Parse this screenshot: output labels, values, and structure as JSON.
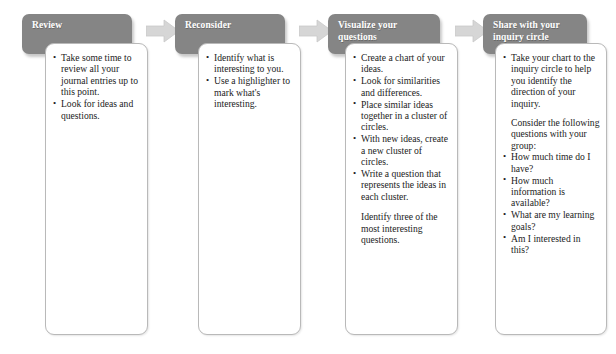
{
  "colors": {
    "header_fill": "#858585",
    "header_text": "#ffffff",
    "card_fill": "#ffffff",
    "card_border": "#b9b9b9",
    "arrow_fill": "#d6d6d6",
    "arrow_border": "#c4c4c4",
    "body_text": "#1b1b1b"
  },
  "steps": [
    {
      "id": "review",
      "title": "Review",
      "bullets": [
        "Take some  time to review all your journal entries up to this point.",
        "Look for ideas and questions."
      ],
      "paragraphs": []
    },
    {
      "id": "reconsider",
      "title": "Reconsider",
      "bullets": [
        "Identify what is interesting  to you.",
        "Use a highlighter to mark what's interesting."
      ],
      "paragraphs": []
    },
    {
      "id": "visualize-your-questions",
      "title": "Visualize your questions",
      "bullets": [
        "Create a chart of your ideas.",
        "Look for similarities and differences.",
        "Place similar ideas  together in a cluster of circles.",
        "With new ideas, create a new cluster of circles.",
        "Write a question that represents the ideas in each cluster."
      ],
      "paragraphs": [
        "Identify three of the most interesting questions."
      ]
    },
    {
      "id": "share-with-your-inquiry-circle",
      "title": "Share with your inquiry circle",
      "bullets_lead": [
        "Take your  chart to the inquiry circle  to help you identify the direction of your inquiry."
      ],
      "paragraph_mid": "Consider the following questions with your group:",
      "bullets": [
        "How much time do I have?",
        "How much information is available?",
        "What are my learning goals?",
        "Am I interested in this?"
      ],
      "paragraphs": []
    }
  ],
  "arrows": [
    {
      "id": "arrow-review-to-reconsider",
      "name": "arrow-1"
    },
    {
      "id": "arrow-reconsider-to-visualize",
      "name": "arrow-2"
    },
    {
      "id": "arrow-visualize-to-share",
      "name": "arrow-3"
    }
  ]
}
